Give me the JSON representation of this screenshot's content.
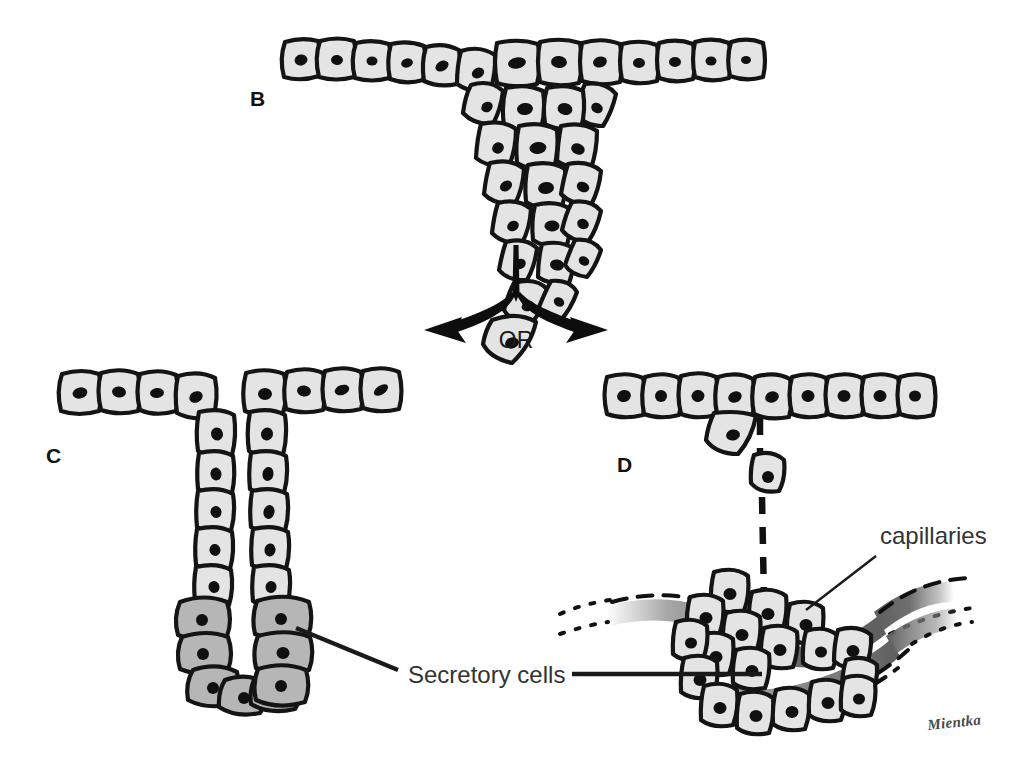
{
  "figure": {
    "kind": "scientific-line-illustration",
    "background_color": "#ffffff",
    "ink_color": "#111111"
  },
  "panels": [
    {
      "id": "B",
      "label": "B",
      "label_x": 250,
      "label_y": 106,
      "description": "Epithelial sheet with a solid downgrowth / cord of proliferating cells forming an inverted triangular bud"
    },
    {
      "id": "C",
      "label": "C",
      "label_x": 46,
      "label_y": 463,
      "description": "Exocrine gland: the cord hollows into a duct that stays connected to the surface; deep cells become secretory"
    },
    {
      "id": "D",
      "label": "D",
      "label_x": 617,
      "label_y": 472,
      "description": "Endocrine gland: the cord loses its connection to the surface and the cell cluster sits against capillaries"
    }
  ],
  "connector": {
    "or_label": "OR",
    "or_x": 516,
    "or_y": 348,
    "stem_top_x": 516,
    "stem_top_y": 240,
    "branch_left_tip": [
      425,
      330
    ],
    "branch_right_tip": [
      575,
      330
    ]
  },
  "annotations": [
    {
      "id": "secretory-cells",
      "text": "Secretory cells",
      "text_x": 408,
      "text_y": 683,
      "anchor": "start",
      "leaders": [
        {
          "from": [
            398,
            670
          ],
          "to": [
            296,
            628
          ]
        },
        {
          "from": [
            572,
            674
          ],
          "to": [
            762,
            674
          ]
        }
      ]
    },
    {
      "id": "capillaries",
      "text": "capillaries",
      "text_x": 880,
      "text_y": 544,
      "anchor": "start",
      "leaders": [
        {
          "from": [
            876,
            556
          ],
          "to": [
            806,
            610
          ]
        }
      ]
    }
  ],
  "signature": {
    "text": "Mientka",
    "x": 928,
    "y": 730
  },
  "palette": {
    "cell_fill_light": "#e4e4e4",
    "cell_fill_secretory": "#b6b6b6",
    "cell_outline": "#141414",
    "nucleus": "#101010",
    "capillary_gray": "#8a8a8a",
    "label_text": "#333333",
    "panel_letter": "#111111"
  },
  "structures": {
    "panel_b": {
      "surface_cells_left": 6,
      "surface_cells_right": 5,
      "bud_cells": 21,
      "bud_shape": "inverted-triangle"
    },
    "panel_c": {
      "surface_cells_left": 4,
      "surface_cells_right": 4,
      "duct_cells_light_per_wall": 5,
      "secretory_cells": 11,
      "lumen": "open to surface"
    },
    "panel_d": {
      "surface_cells": 9,
      "budding_cell": 1,
      "migrating_cells": 1,
      "cluster_cells": 22,
      "capillary_bands": 2,
      "surface_connection": "lost (dashed)"
    }
  }
}
